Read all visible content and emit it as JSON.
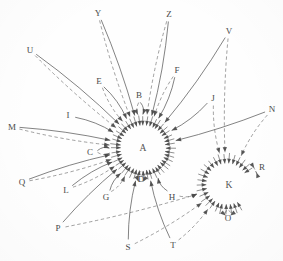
{
  "figure": {
    "type": "node-link-diagram",
    "title": "",
    "background_color": "#fefefe",
    "ink_color": "#4a4a4a",
    "width": 283,
    "height": 261
  },
  "hubs": [
    {
      "id": "A",
      "label": "A",
      "x": 143,
      "y": 148,
      "radius": 22,
      "label_x": 143,
      "label_y": 149
    },
    {
      "id": "K",
      "label": "K",
      "x": 227,
      "y": 184,
      "radius": 20,
      "label_x": 229,
      "label_y": 186
    }
  ],
  "nodes": [
    {
      "id": "Y",
      "label": "Y",
      "x": 98,
      "y": 13,
      "hub": "A"
    },
    {
      "id": "Z",
      "label": "Z",
      "x": 169,
      "y": 14,
      "hub": "A"
    },
    {
      "id": "V",
      "label": "V",
      "x": 229,
      "y": 31,
      "hub": "A"
    },
    {
      "id": "U",
      "label": "U",
      "x": 30,
      "y": 50,
      "hub": "A"
    },
    {
      "id": "F",
      "label": "F",
      "x": 177,
      "y": 70,
      "hub": "A"
    },
    {
      "id": "E",
      "label": "E",
      "x": 99,
      "y": 81,
      "hub": "A"
    },
    {
      "id": "B",
      "label": "B",
      "x": 139,
      "y": 95,
      "hub": "A"
    },
    {
      "id": "J",
      "label": "J",
      "x": 213,
      "y": 98,
      "hub": "A"
    },
    {
      "id": "N",
      "label": "N",
      "x": 272,
      "y": 109,
      "hub": "K"
    },
    {
      "id": "I",
      "label": "I",
      "x": 68,
      "y": 115,
      "hub": "A"
    },
    {
      "id": "M",
      "label": "M",
      "x": 12,
      "y": 127,
      "hub": "A"
    },
    {
      "id": "C",
      "label": "C",
      "x": 90,
      "y": 152,
      "hub": "A"
    },
    {
      "id": "R",
      "label": "R",
      "x": 262,
      "y": 167,
      "hub": "K"
    },
    {
      "id": "D",
      "label": "D",
      "x": 141,
      "y": 179,
      "hub": "A"
    },
    {
      "id": "Q",
      "label": "Q",
      "x": 22,
      "y": 182,
      "hub": "A"
    },
    {
      "id": "L",
      "label": "L",
      "x": 66,
      "y": 190,
      "hub": "A"
    },
    {
      "id": "G",
      "label": "G",
      "x": 106,
      "y": 197,
      "hub": "A"
    },
    {
      "id": "H",
      "label": "H",
      "x": 172,
      "y": 197,
      "hub": "A"
    },
    {
      "id": "O",
      "label": "O",
      "x": 228,
      "y": 218,
      "hub": "K"
    },
    {
      "id": "P",
      "label": "P",
      "x": 58,
      "y": 228,
      "hub": "A"
    },
    {
      "id": "T",
      "label": "T",
      "x": 173,
      "y": 245,
      "hub": "A"
    },
    {
      "id": "S",
      "label": "S",
      "x": 128,
      "y": 247,
      "hub": "A"
    }
  ],
  "edges": [
    {
      "from": "Y",
      "to": "A",
      "style": "solid"
    },
    {
      "from": "Y",
      "to": "A",
      "style": "dashed"
    },
    {
      "from": "Z",
      "to": "A",
      "style": "solid"
    },
    {
      "from": "Z",
      "to": "A",
      "style": "dashed"
    },
    {
      "from": "V",
      "to": "A",
      "style": "solid"
    },
    {
      "from": "V",
      "to": "K",
      "style": "dashed"
    },
    {
      "from": "U",
      "to": "A",
      "style": "solid"
    },
    {
      "from": "U",
      "to": "A",
      "style": "dashed"
    },
    {
      "from": "F",
      "to": "A",
      "style": "solid"
    },
    {
      "from": "F",
      "to": "A",
      "style": "dashed"
    },
    {
      "from": "E",
      "to": "A",
      "style": "solid"
    },
    {
      "from": "E",
      "to": "A",
      "style": "dashed"
    },
    {
      "from": "B",
      "to": "A",
      "style": "solid"
    },
    {
      "from": "B",
      "to": "A",
      "style": "dashed"
    },
    {
      "from": "J",
      "to": "A",
      "style": "solid"
    },
    {
      "from": "J",
      "to": "K",
      "style": "dashed"
    },
    {
      "from": "N",
      "to": "A",
      "style": "solid"
    },
    {
      "from": "N",
      "to": "K",
      "style": "dashed"
    },
    {
      "from": "I",
      "to": "A",
      "style": "solid"
    },
    {
      "from": "M",
      "to": "A",
      "style": "solid"
    },
    {
      "from": "M",
      "to": "A",
      "style": "dashed"
    },
    {
      "from": "C",
      "to": "A",
      "style": "solid"
    },
    {
      "from": "C",
      "to": "A",
      "style": "dashed"
    },
    {
      "from": "R",
      "to": "K",
      "style": "solid"
    },
    {
      "from": "R",
      "to": "K",
      "style": "dashed"
    },
    {
      "from": "D",
      "to": "A",
      "style": "solid"
    },
    {
      "from": "D",
      "to": "A",
      "style": "dashed"
    },
    {
      "from": "Q",
      "to": "A",
      "style": "solid"
    },
    {
      "from": "Q",
      "to": "A",
      "style": "dashed"
    },
    {
      "from": "L",
      "to": "A",
      "style": "solid"
    },
    {
      "from": "L",
      "to": "A",
      "style": "dashed"
    },
    {
      "from": "G",
      "to": "A",
      "style": "solid"
    },
    {
      "from": "G",
      "to": "A",
      "style": "dashed"
    },
    {
      "from": "H",
      "to": "A",
      "style": "solid"
    },
    {
      "from": "H",
      "to": "K",
      "style": "dashed"
    },
    {
      "from": "O",
      "to": "K",
      "style": "solid"
    },
    {
      "from": "O",
      "to": "K",
      "style": "dashed"
    },
    {
      "from": "P",
      "to": "A",
      "style": "solid"
    },
    {
      "from": "P",
      "to": "K",
      "style": "dashed"
    },
    {
      "from": "T",
      "to": "A",
      "style": "solid"
    },
    {
      "from": "T",
      "to": "K",
      "style": "dashed"
    },
    {
      "from": "S",
      "to": "A",
      "style": "solid"
    },
    {
      "from": "S",
      "to": "K",
      "style": "dashed"
    }
  ],
  "hub_spokes": {
    "A_count": 44,
    "K_count": 26
  }
}
